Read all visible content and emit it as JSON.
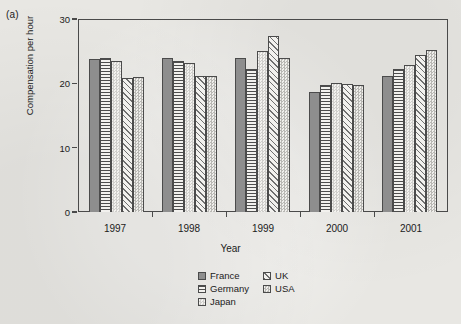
{
  "panel_label": "(a)",
  "chart_data": {
    "type": "bar",
    "title": "",
    "xlabel": "Year",
    "ylabel": "Compensation per hour",
    "categories": [
      "1997",
      "1998",
      "1999",
      "2000",
      "2001"
    ],
    "yticks": [
      0,
      10,
      20,
      30
    ],
    "ylim": [
      0,
      30
    ],
    "grid": false,
    "legend_position": "bottom-center",
    "series": [
      {
        "name": "France",
        "pattern": "solid",
        "values": [
          23.8,
          24.0,
          23.9,
          18.7,
          21.2
        ]
      },
      {
        "name": "Germany",
        "pattern": "horizontal-lines",
        "values": [
          23.9,
          23.5,
          22.2,
          19.7,
          22.3
        ]
      },
      {
        "name": "Japan",
        "pattern": "checker-light",
        "values": [
          23.5,
          23.1,
          25.1,
          20.1,
          22.8
        ]
      },
      {
        "name": "UK",
        "pattern": "diagonal-hatch",
        "values": [
          20.8,
          21.2,
          27.3,
          19.9,
          24.4
        ]
      },
      {
        "name": "USA",
        "pattern": "checker-dark",
        "values": [
          21.0,
          21.2,
          23.9,
          19.8,
          25.2
        ]
      }
    ]
  },
  "legend": {
    "items": [
      {
        "label": "France",
        "pattern": "solid"
      },
      {
        "label": "UK",
        "pattern": "diagonal-hatch"
      },
      {
        "label": "Germany",
        "pattern": "horizontal-lines"
      },
      {
        "label": "USA",
        "pattern": "checker-dark"
      },
      {
        "label": "Japan",
        "pattern": "checker-light"
      }
    ]
  }
}
